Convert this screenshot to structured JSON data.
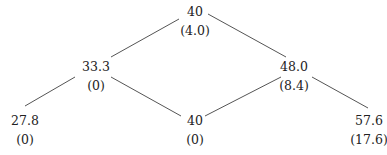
{
  "diagram": {
    "type": "binomial-tree",
    "nodes": [
      {
        "id": "root",
        "value": "40",
        "sub": "(4.0)"
      },
      {
        "id": "up",
        "value": "48.0",
        "sub": "(8.4)"
      },
      {
        "id": "down",
        "value": "33.3",
        "sub": "(0)"
      },
      {
        "id": "up-up",
        "value": "57.6",
        "sub": "(17.6)"
      },
      {
        "id": "up-down",
        "value": "40",
        "sub": "(0)"
      },
      {
        "id": "down-down",
        "value": "27.8",
        "sub": "(0)"
      }
    ],
    "edges": [
      [
        "root",
        "down"
      ],
      [
        "root",
        "up"
      ],
      [
        "down",
        "down-down"
      ],
      [
        "down",
        "up-down"
      ],
      [
        "up",
        "up-down"
      ],
      [
        "up",
        "up-up"
      ]
    ],
    "colors": {
      "text": "#222222",
      "line": "#555555",
      "background": "#ffffff"
    }
  }
}
